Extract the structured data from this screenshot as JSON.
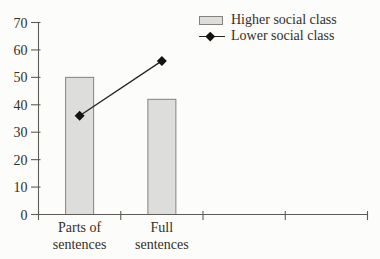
{
  "chart_data": {
    "type": "combo",
    "categories": [
      "Parts of\nsentences",
      "Full\nsentences"
    ],
    "series": [
      {
        "name": "Higher social class",
        "type": "bar",
        "values": [
          50,
          42
        ]
      },
      {
        "name": "Lower social class",
        "type": "line",
        "marker": "diamond",
        "values": [
          36,
          56
        ]
      }
    ],
    "title": "",
    "xlabel": "",
    "ylabel": "",
    "ylim": [
      0,
      70
    ],
    "yticks": [
      0,
      10,
      20,
      30,
      40,
      50,
      60,
      70
    ],
    "grid": false,
    "legend_position": "top-right",
    "x_axis_total_slots": 4
  },
  "legend": {
    "items": [
      {
        "label": "Higher social class",
        "swatch": "bar"
      },
      {
        "label": "Lower social class",
        "swatch": "line-diamond"
      }
    ]
  },
  "colors": {
    "bar_fill": "#dddddb",
    "bar_border": "#85827e",
    "line": "#26231f",
    "marker": "#16130f",
    "axis": "#5f5c57",
    "text": "#332f2a",
    "background": "#fcfcfa"
  }
}
